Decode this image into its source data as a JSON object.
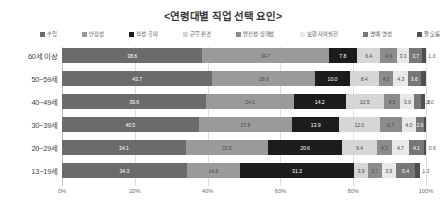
{
  "chart_data": {
    "type": "bar",
    "subtype": "stacked-bar-horizontal-100pct",
    "title": "<연령대별 직업 선택 요인>",
    "xlabel": "",
    "ylabel": "",
    "xlim": [
      0,
      100
    ],
    "xticks": [
      "0%",
      "20%",
      "40%",
      "60%",
      "80%",
      "100%"
    ],
    "xtick_values": [
      0,
      20,
      40,
      60,
      80,
      100
    ],
    "grid": true,
    "legend_position": "top",
    "categories": [
      "60세 이상",
      "50~59세",
      "40~49세",
      "30~39세",
      "20~29세",
      "13~19세"
    ],
    "series": [
      {
        "name": "수입",
        "color": "#6b6b6b",
        "values": [
          38.6,
          43.7,
          39.6,
          40.5,
          34.1,
          34.3
        ]
      },
      {
        "name": "안정성",
        "color": "#9a9a9a",
        "values": [
          34.7,
          29.9,
          24.1,
          27.8,
          22.5,
          14.6
        ]
      },
      {
        "name": "적성·흥미",
        "color": "#1c1c1c",
        "values": [
          7.8,
          10.0,
          14.2,
          13.9,
          20.6,
          31.3
        ]
      },
      {
        "name": "근무 환경",
        "color": "#d6d6d6",
        "values": [
          6.4,
          8.4,
          10.5,
          12.0,
          9.4,
          3.9
        ]
      },
      {
        "name": "발전성·장래성",
        "color": "#8c8c8c",
        "values": [
          4.6,
          4.3,
          4.5,
          6.7,
          4.2,
          3.7
        ]
      },
      {
        "name": "보람·자아실현",
        "color": "#e8e8e8",
        "values": [
          3.3,
          4.3,
          3.9,
          4.0,
          4.7,
          3.9
        ]
      },
      {
        "name": "명예·명성",
        "color": "#777777",
        "values": [
          3.7,
          3.6,
          1.8,
          2.6,
          4.1,
          5.4
        ]
      },
      {
        "name": "잘 모름",
        "color": "#4f4f4f",
        "values": [
          1.0,
          1.6,
          1.0,
          0.5,
          0.6,
          1.3
        ]
      }
    ]
  },
  "legend": {
    "items": [
      {
        "label": "수입",
        "color": "#6b6b6b"
      },
      {
        "label": "안정성",
        "color": "#9a9a9a"
      },
      {
        "label": "적성·흥미",
        "color": "#1c1c1c"
      },
      {
        "label": "근무 환경",
        "color": "#d6d6d6"
      },
      {
        "label": "발전성·장래성",
        "color": "#8c8c8c"
      },
      {
        "label": "보람·자아실현",
        "color": "#e8e8e8"
      },
      {
        "label": "명예·명성",
        "color": "#777777"
      },
      {
        "label": "잘 모름",
        "color": "#4f4f4f"
      }
    ]
  },
  "style": {
    "gridline_color": "#dedede",
    "axis_color": "#c8c8c8",
    "title_color": "#3a3a3a",
    "label_light": "#ffffff",
    "label_dark": "#4a4a4a",
    "background": "#ffffff"
  }
}
